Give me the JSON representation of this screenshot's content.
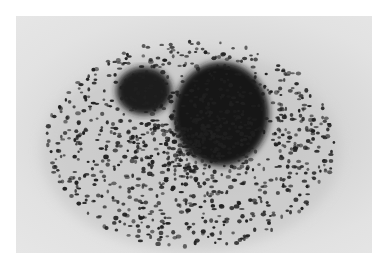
{
  "image": {
    "description": "Grayscale micrograph of a cell with dense dark granules; two dark nuclear lobes surrounded by scattered granules",
    "colors": {
      "border": "#ffffff",
      "background": "#e2e2e2",
      "cytoplasm": "#c8c8c8",
      "granule": "#1e1e1e",
      "nucleus": "#161616"
    }
  }
}
